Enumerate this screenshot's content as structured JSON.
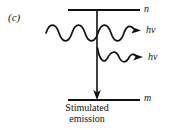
{
  "figure": {
    "panel_label": "(c)",
    "background_color": "#ffffff",
    "ink_color": "#111111",
    "width": 174,
    "height": 130
  },
  "energy_levels": {
    "upper": {
      "label": "n",
      "y": 10,
      "x_start": 68,
      "x_end": 140
    },
    "lower": {
      "label": "m",
      "y": 100,
      "x_start": 68,
      "x_end": 140
    }
  },
  "transition_arrow": {
    "name": "downward-transition",
    "x": 97,
    "y_start": 10,
    "y_end": 99,
    "direction": "down"
  },
  "photons": [
    {
      "id": "incident-and-transmitted-photon",
      "label": "hν",
      "y": 33,
      "x_start": 46,
      "x_end": 133,
      "cycles": 4,
      "amplitude": 7
    },
    {
      "id": "stimulated-photon",
      "label": "hν",
      "y": 58,
      "x_start": 97,
      "x_end": 134,
      "cycles": 2,
      "amplitude": 7
    }
  ],
  "caption": {
    "line1": "Stimulated",
    "line2": "emission"
  }
}
